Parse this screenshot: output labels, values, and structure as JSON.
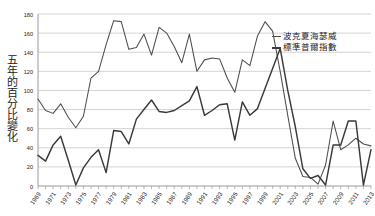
{
  "chart_data": {
    "type": "line",
    "title": "",
    "xlabel": "",
    "ylabel": "五年的百分比變化",
    "ylim": [
      0,
      180
    ],
    "yticks": [
      0,
      20,
      40,
      60,
      80,
      100,
      120,
      140,
      160,
      180
    ],
    "grid": true,
    "legend_position": "top-right",
    "x": [
      1969,
      1970,
      1971,
      1972,
      1973,
      1974,
      1975,
      1976,
      1977,
      1978,
      1979,
      1980,
      1981,
      1982,
      1983,
      1984,
      1985,
      1986,
      1987,
      1988,
      1989,
      1990,
      1991,
      1992,
      1993,
      1994,
      1995,
      1996,
      1997,
      1998,
      1999,
      2000,
      2001,
      2002,
      2003,
      2004,
      2005,
      2006,
      2007,
      2008,
      2009,
      2010,
      2011,
      2012,
      2013
    ],
    "xticks": [
      1969,
      1971,
      1973,
      1975,
      1977,
      1979,
      1981,
      1983,
      1985,
      1987,
      1989,
      1991,
      1993,
      1995,
      1997,
      1999,
      2001,
      2003,
      2005,
      2007,
      2009,
      2011,
      2013
    ],
    "series": [
      {
        "name": "波克夏海瑟威",
        "values": [
          91,
          79,
          76,
          86,
          72,
          61,
          73,
          113,
          120,
          148,
          173,
          172,
          143,
          145,
          159,
          137,
          166,
          160,
          146,
          129,
          159,
          120,
          132,
          134,
          133,
          113,
          98,
          132,
          126,
          157,
          172,
          162,
          120,
          74,
          29,
          10,
          9,
          2,
          22,
          68,
          38,
          43,
          50,
          44,
          42
        ]
      },
      {
        "name": "標準普爾指數",
        "values": [
          32,
          26,
          43,
          52,
          27,
          1,
          19,
          30,
          38,
          14,
          58,
          57,
          44,
          70,
          80,
          90,
          78,
          77,
          79,
          84,
          89,
          104,
          74,
          79,
          85,
          86,
          48,
          88,
          74,
          81,
          102,
          123,
          144,
          100,
          62,
          18,
          8,
          11,
          1,
          43,
          43,
          68,
          68,
          1,
          38
        ]
      }
    ],
    "annotations": {
      "berkshire_peak_1979": 173,
      "berkshire_peak_1998": 172,
      "sp_peak_2001": 144,
      "final_2013_berkshire": 88,
      "final_2013_sp": 130
    }
  },
  "legend": {
    "items": [
      {
        "label": "波克夏海瑟威",
        "style": "thin"
      },
      {
        "label": "標準普爾指數",
        "style": "thick"
      }
    ]
  },
  "colors": {
    "series_1": "#4d4d4d",
    "series_2": "#3a3a3a",
    "grid": "#c8c8c8",
    "axis": "#9a9a9a",
    "text": "#1c1c1c"
  }
}
